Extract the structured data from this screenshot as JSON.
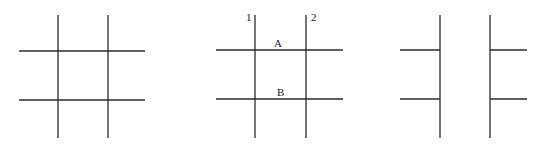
{
  "diagram": {
    "colors": {
      "line": "#2a2a2a",
      "background": "#ffffff",
      "text": "#222222"
    },
    "panels": [
      {
        "id": "panel-1",
        "vertical_lines": [
          {
            "x": 58,
            "y1": 15,
            "y2": 138
          },
          {
            "x": 108,
            "y1": 15,
            "y2": 138
          }
        ],
        "horizontal_lines": [
          {
            "y": 51,
            "x1": 19,
            "x2": 145
          },
          {
            "y": 100,
            "x1": 19,
            "x2": 145
          }
        ],
        "labels": []
      },
      {
        "id": "panel-2",
        "vertical_lines": [
          {
            "x": 255,
            "y1": 15,
            "y2": 138
          },
          {
            "x": 306,
            "y1": 15,
            "y2": 138
          }
        ],
        "horizontal_lines": [
          {
            "y": 50,
            "x1": 216,
            "x2": 343
          },
          {
            "y": 99,
            "x1": 216,
            "x2": 343
          }
        ],
        "labels": [
          {
            "text": "1",
            "x": 246,
            "y": 21
          },
          {
            "text": "2",
            "x": 311,
            "y": 21
          },
          {
            "text": "A",
            "x": 274,
            "y": 47
          },
          {
            "text": "B",
            "x": 277,
            "y": 96
          }
        ]
      },
      {
        "id": "panel-3",
        "vertical_lines": [
          {
            "x": 440,
            "y1": 15,
            "y2": 138
          },
          {
            "x": 490,
            "y1": 15,
            "y2": 138
          }
        ],
        "horizontal_lines": [
          {
            "y": 50,
            "x1": 400,
            "x2": 440
          },
          {
            "y": 99,
            "x1": 400,
            "x2": 440
          },
          {
            "y": 50,
            "x1": 490,
            "x2": 527
          },
          {
            "y": 99,
            "x1": 490,
            "x2": 527
          }
        ],
        "labels": []
      }
    ]
  }
}
